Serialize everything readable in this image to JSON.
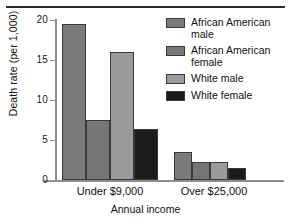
{
  "chart_data": {
    "type": "bar",
    "title": "",
    "xlabel": "Annual income",
    "ylabel": "Death rate (per 1,000)",
    "categories": [
      "Under $9,000",
      "Over $25,000"
    ],
    "ylim": [
      0,
      20
    ],
    "yticks": [
      0,
      5,
      10,
      15,
      20
    ],
    "ytick_labels": [
      "0",
      "5",
      "10",
      "15",
      "20"
    ],
    "grid": false,
    "legend_position": "top-right",
    "series": [
      {
        "name": "African American\nmale",
        "color": "#7b7b7b",
        "values": [
          19.5,
          3.5
        ]
      },
      {
        "name": "African American\nfemale",
        "color": "#767676",
        "values": [
          7.5,
          2.3
        ]
      },
      {
        "name": "White male",
        "color": "#9b9b9b",
        "values": [
          16.0,
          2.3
        ]
      },
      {
        "name": "White female",
        "color": "#1c1c1c",
        "values": [
          6.4,
          1.5
        ]
      }
    ]
  },
  "axis": {
    "y_title": "Death rate (per 1,000)",
    "x_title": "Annual income",
    "ticks": [
      "20",
      "15",
      "10",
      "5",
      "0"
    ],
    "tick_color": "#8d8d8d"
  },
  "legend": {
    "entries": [
      {
        "label": "African American\nmale",
        "color": "#7b7b7b"
      },
      {
        "label": "African American\nfemale",
        "color": "#767676"
      },
      {
        "label": "White male",
        "color": "#9b9b9b"
      },
      {
        "label": "White female",
        "color": "#1c1c1c"
      }
    ]
  },
  "groups": [
    {
      "label": "Under $9,000"
    },
    {
      "label": "Over $25,000"
    }
  ]
}
